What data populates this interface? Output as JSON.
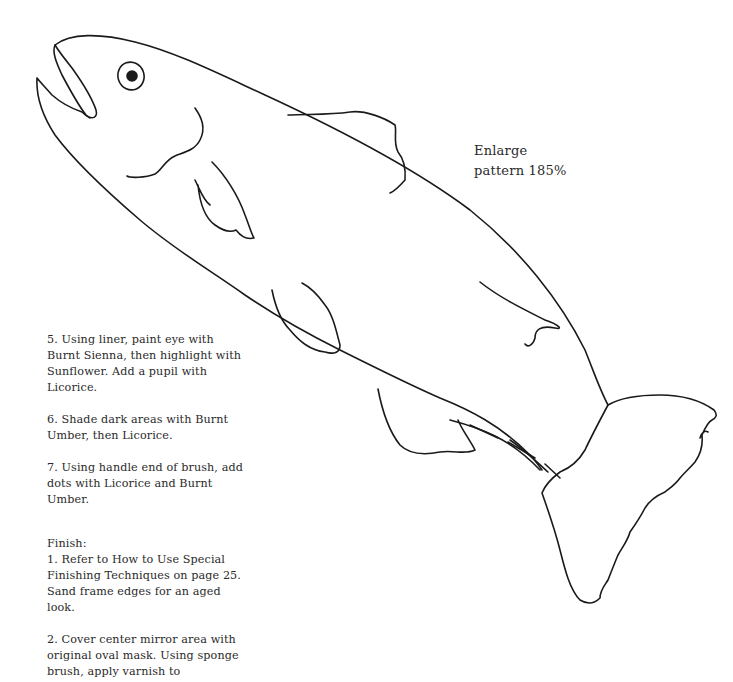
{
  "pattern_note": {
    "line1": "Enlarge",
    "line2": "pattern 185%"
  },
  "steps": [
    {
      "id": 5,
      "text": "5. Using liner, paint eye with Burnt Sienna, then highlight with Sunflower. Add a pupil with Licorice."
    },
    {
      "id": 6,
      "text": "6. Shade dark areas with Burnt Umber, then Licorice."
    },
    {
      "id": 7,
      "text": "7. Using handle end of brush, add dots with Licorice and Burnt Umber."
    }
  ],
  "finish": {
    "heading": "Finish:",
    "steps": [
      {
        "id": 1,
        "text": "1. Refer to How to Use Special Finishing Techniques on page 25. Sand frame edges for an aged look."
      },
      {
        "id": 2,
        "text": "2. Cover center mirror area with original oval mask. Using sponge brush, apply varnish to"
      }
    ]
  },
  "illustration": {
    "subject": "fish-outline-pattern",
    "stroke_color": "#1a1a1a"
  }
}
